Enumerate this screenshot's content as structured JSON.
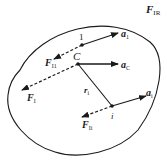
{
  "diagram": {
    "type": "rigid-body-inertial-forces",
    "labels": {
      "resultant_force": {
        "main": "F",
        "sub": "IR"
      },
      "point_1": "1",
      "accel_1": {
        "main": "a",
        "sub": "1"
      },
      "force_1": {
        "main": "F",
        "sub": "I1"
      },
      "center": "C",
      "accel_c": {
        "main": "a",
        "sub": "C"
      },
      "force_c": {
        "main": "F",
        "sub": "I"
      },
      "radius": {
        "main": "r",
        "sub": "i"
      },
      "point_i": "i",
      "accel_i": {
        "main": "a",
        "sub": "i"
      },
      "force_i": {
        "main": "F",
        "sub": "Ii"
      }
    },
    "colors": {
      "stroke": "#1a1a1a",
      "background": "#ffffff"
    }
  }
}
